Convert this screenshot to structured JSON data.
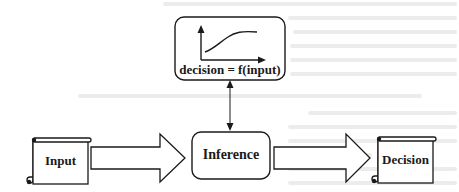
{
  "diagram": {
    "function_box": {
      "label": "decision = f(input)",
      "icon": "sigmoid-curve-graph"
    },
    "nodes": [
      {
        "id": "input",
        "label": "Input",
        "shape": "scroll"
      },
      {
        "id": "inference",
        "label": "Inference",
        "shape": "rounded-rectangle"
      },
      {
        "id": "decision",
        "label": "Decision",
        "shape": "scroll"
      }
    ],
    "edges": [
      {
        "from": "input",
        "to": "inference",
        "style": "block-arrow"
      },
      {
        "from": "inference",
        "to": "decision",
        "style": "block-arrow"
      },
      {
        "from": "inference",
        "to": "function_box",
        "style": "double-headed-line"
      }
    ],
    "colors": {
      "stroke": "#1a1a1a",
      "background": "#ffffff",
      "bleed_through": "#e6e6e6"
    }
  }
}
